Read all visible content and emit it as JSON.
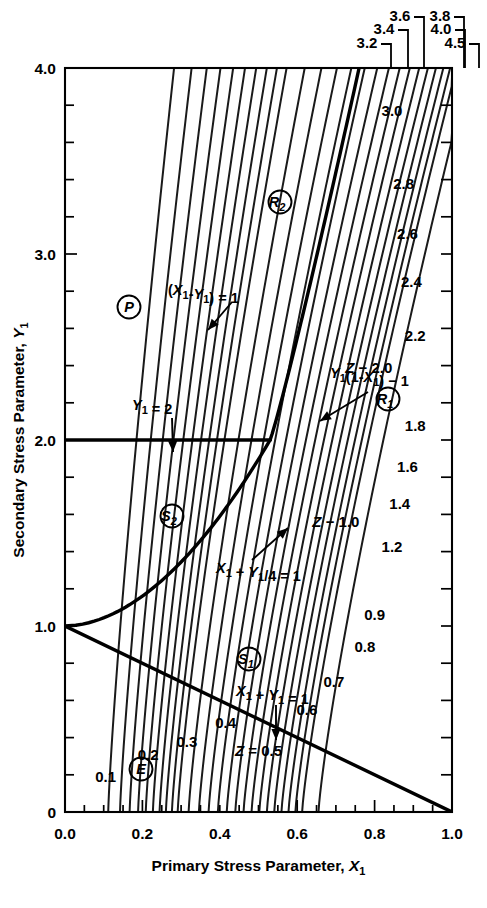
{
  "chart_data": {
    "type": "line",
    "title": "",
    "xlabel": "Primary Stress Parameter, X1",
    "ylabel": "Secondary Stress Parameter, Y1",
    "xlim": [
      0.0,
      1.0
    ],
    "ylim": [
      0.0,
      4.0
    ],
    "grid": false,
    "legend_position": "none",
    "x_ticks": [
      "0.0",
      "0.2",
      "0.4",
      "0.6",
      "0.8",
      "1.0"
    ],
    "x_tick_values": [
      0.0,
      0.2,
      0.4,
      0.6,
      0.8,
      1.0
    ],
    "y_ticks": [
      "0",
      "1.0",
      "2.0",
      "3.0",
      "4.0"
    ],
    "y_tick_values": [
      0.0,
      1.0,
      2.0,
      3.0,
      4.0
    ],
    "x_minor_step": 0.05,
    "y_minor_step": 0.2,
    "contour_family": "Z",
    "contour_note": "All Z contours converge at the point (X1=1.0, Y1=0).",
    "contours": [
      {
        "z": 0.1,
        "label": "0.1",
        "label_x": 0.105,
        "label_y": 0.16
      },
      {
        "z": 0.2,
        "label": "0.2",
        "label_x": 0.215,
        "label_y": 0.28
      },
      {
        "z": 0.3,
        "label": "0.3",
        "label_x": 0.315,
        "label_y": 0.35
      },
      {
        "z": 0.4,
        "label": "0.4",
        "label_x": 0.415,
        "label_y": 0.45
      },
      {
        "z": 0.5,
        "label": "Z = 0.5",
        "label_x": 0.5,
        "label_y": 0.3
      },
      {
        "z": 0.6,
        "label": "0.6",
        "label_x": 0.625,
        "label_y": 0.52
      },
      {
        "z": 0.7,
        "label": "0.7",
        "label_x": 0.695,
        "label_y": 0.67
      },
      {
        "z": 0.8,
        "label": "0.8",
        "label_x": 0.775,
        "label_y": 0.86
      },
      {
        "z": 0.9,
        "label": "0.9",
        "label_x": 0.8,
        "label_y": 1.03
      },
      {
        "z": 1.0,
        "label": "Z − 1.0",
        "label_x": 0.7,
        "label_y": 1.53
      },
      {
        "z": 1.2,
        "label": "1.2",
        "label_x": 0.845,
        "label_y": 1.4
      },
      {
        "z": 1.4,
        "label": "1.4",
        "label_x": 0.865,
        "label_y": 1.63
      },
      {
        "z": 1.6,
        "label": "1.6",
        "label_x": 0.885,
        "label_y": 1.83
      },
      {
        "z": 1.8,
        "label": "1.8",
        "label_x": 0.905,
        "label_y": 2.05
      },
      {
        "z": 2.0,
        "label": "Z − 2.0",
        "label_x": 0.785,
        "label_y": 2.36
      },
      {
        "z": 2.2,
        "label": "2.2",
        "label_x": 0.905,
        "label_y": 2.53
      },
      {
        "z": 2.4,
        "label": "2.4",
        "label_x": 0.895,
        "label_y": 2.82
      },
      {
        "z": 2.6,
        "label": "2.6",
        "label_x": 0.885,
        "label_y": 3.08
      },
      {
        "z": 2.8,
        "label": "2.8",
        "label_x": 0.875,
        "label_y": 3.35
      },
      {
        "z": 3.0,
        "label": "3.0",
        "label_x": 0.845,
        "label_y": 3.74
      }
    ],
    "top_labels": [
      {
        "label": "3.2",
        "x": 367,
        "y": 36
      },
      {
        "label": "3.4",
        "x": 384,
        "y": 22
      },
      {
        "label": "3.6",
        "x": 400,
        "y": 9
      },
      {
        "label": "3.8",
        "x": 440,
        "y": 9
      },
      {
        "label": "4.0",
        "x": 441,
        "y": 22
      },
      {
        "label": "4.5",
        "x": 455,
        "y": 36
      }
    ],
    "boundary_curves": [
      {
        "name": "X1+Y1=1",
        "label": "X1 + Y1 = 1",
        "type": "straight",
        "from": [
          0.0,
          1.0
        ],
        "to": [
          1.0,
          0.0
        ]
      },
      {
        "name": "X1+Y1/4=1",
        "label": "X1 + Y1/4 = 1",
        "type": "curve",
        "from": [
          0.0,
          1.0
        ],
        "to": [
          0.53,
          2.0
        ]
      },
      {
        "name": "Y1=2",
        "label": "Y1 = 2",
        "type": "horizontal",
        "from": [
          0.0,
          2.0
        ],
        "to": [
          0.53,
          2.0
        ]
      },
      {
        "name": "Y1(1-X1)-1",
        "label": "Y1(1-X1) − 1",
        "type": "curve",
        "from": [
          0.53,
          2.0
        ],
        "to": [
          0.76,
          4.0
        ]
      },
      {
        "name": "(X1-Y1)=1",
        "label": "(X1 - Y1) = 1",
        "type": "contour-pointer"
      }
    ],
    "annotations": [
      {
        "name": "x1-minus-y1-eq-1",
        "text": "(X1-Y1) = 1",
        "x": 168,
        "y": 295
      },
      {
        "name": "y1-eq-2",
        "text": "Y1 = 2",
        "x": 132,
        "y": 410
      },
      {
        "name": "y1-1-minus-x1",
        "text": "Y1(1-X1) − 1",
        "x": 330,
        "y": 378
      },
      {
        "name": "x1-plus-y1-over-4",
        "text": "X1 + Y1/4 = 1",
        "x": 216,
        "y": 573
      },
      {
        "name": "x1-plus-y1-eq-1",
        "text": "X1 + Y1 = 1",
        "x": 236,
        "y": 696
      }
    ],
    "region_labels": [
      {
        "name": "region-P",
        "text": "P",
        "x": 129,
        "y": 307
      },
      {
        "name": "region-R2",
        "text": "R2",
        "x": 280,
        "y": 202
      },
      {
        "name": "region-R1",
        "text": "R1",
        "x": 388,
        "y": 399
      },
      {
        "name": "region-S2",
        "text": "S2",
        "x": 172,
        "y": 516
      },
      {
        "name": "region-S1",
        "text": "S1",
        "x": 249,
        "y": 659
      },
      {
        "name": "region-E",
        "text": "E",
        "x": 141,
        "y": 769
      }
    ]
  },
  "axes": {
    "x_title_prefix": "Primary Stress Parameter, ",
    "x_title_var": "X",
    "x_title_sub": "1",
    "y_title_prefix": "Secondary Stress Parameter, ",
    "y_title_var": "Y",
    "y_title_sub": "1"
  }
}
